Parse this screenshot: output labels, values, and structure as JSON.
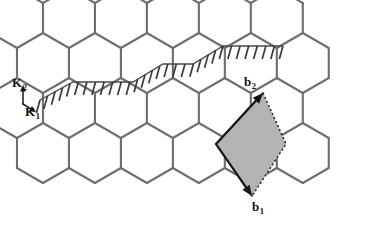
{
  "figure": {
    "name": "honeycomb-lattice-diagram",
    "background_color": "#ffffff",
    "lattice_line_color": "#6e6e6e",
    "unit_cell_fill_color": "#b3b3b3",
    "arrow_color": "#161616",
    "hatch_color": "#3a3a3a"
  },
  "labels": {
    "k1": {
      "text": "K",
      "sub": "1"
    },
    "k2": {
      "text": "K",
      "sub": "2"
    },
    "b1": {
      "text": "b",
      "sub": "1"
    },
    "b2": {
      "text": "b",
      "sub": "2"
    }
  },
  "chart_data": {
    "type": "diagram",
    "title": "",
    "lattice": {
      "kind": "honeycomb",
      "hex_orientation": "pointy-top",
      "hex_radius": 30,
      "columns": 6,
      "rows": 4,
      "origin": {
        "x": 17,
        "y": 18
      }
    },
    "unit_cell": {
      "shape": "rhombus",
      "fill": "#b3b3b3",
      "solid_edges": 2,
      "dotted_edges": 2,
      "vertices": [
        {
          "x": 216,
          "y": 144
        },
        {
          "x": 263,
          "y": 93
        },
        {
          "x": 286,
          "y": 144
        },
        {
          "x": 252,
          "y": 196
        }
      ]
    },
    "vectors": [
      {
        "name": "b2",
        "origin": {
          "x": 216,
          "y": 144
        },
        "tip": {
          "x": 263,
          "y": 93
        },
        "direction": "up-right",
        "style": "solid"
      },
      {
        "name": "b1",
        "origin": {
          "x": 216,
          "y": 144
        },
        "tip": {
          "x": 252,
          "y": 196
        },
        "direction": "down-right",
        "style": "solid"
      },
      {
        "name": "K2",
        "origin": {
          "x": 23,
          "y": 104
        },
        "tip": {
          "x": 23,
          "y": 85
        },
        "direction": "up",
        "style": "solid"
      },
      {
        "name": "K1",
        "origin": {
          "x": 23,
          "y": 104
        },
        "tip": {
          "x": 36,
          "y": 112
        },
        "direction": "down-right",
        "style": "solid"
      }
    ],
    "hatched_band": {
      "description": "zigzag cut line with short diagonal tick hatching",
      "tick_count": 30,
      "path_points": [
        {
          "x": 40,
          "y": 100
        },
        {
          "x": 73,
          "y": 82
        },
        {
          "x": 133,
          "y": 82
        },
        {
          "x": 163,
          "y": 64
        },
        {
          "x": 193,
          "y": 64
        },
        {
          "x": 223,
          "y": 46
        },
        {
          "x": 283,
          "y": 46
        }
      ]
    }
  }
}
